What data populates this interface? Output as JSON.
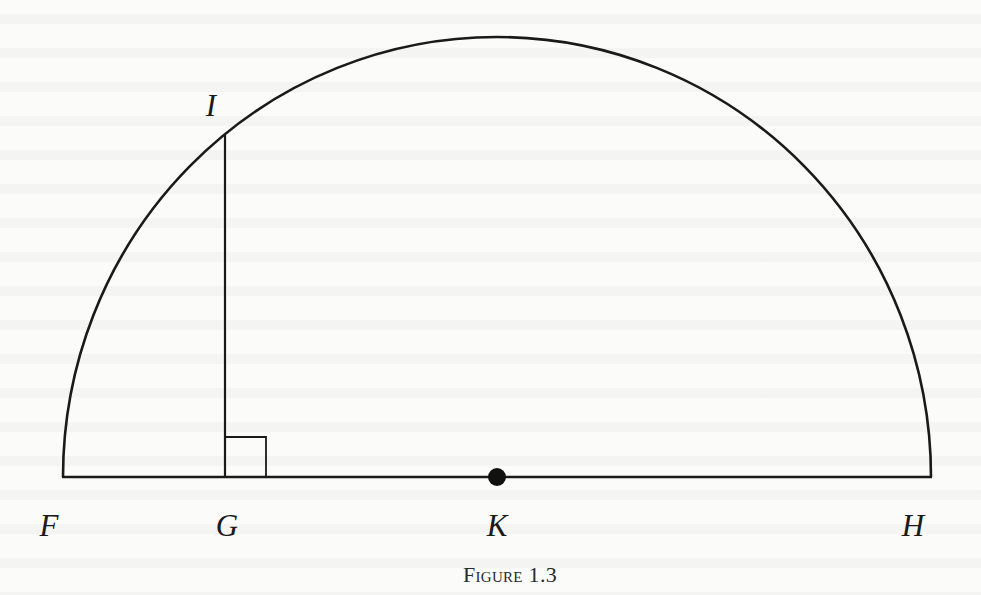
{
  "figure": {
    "caption": "Figure 1.3",
    "stroke_color": "#1a1a1a",
    "geometry": {
      "baseline_y": 477,
      "F_x": 63,
      "H_x": 931,
      "K_x": 497,
      "radius": 434,
      "G_x": 225,
      "I_y": 135,
      "right_angle_size": 40,
      "center_dot_radius": 9
    },
    "labels": {
      "I": "I",
      "F": "F",
      "G": "G",
      "K": "K",
      "H": "H"
    }
  }
}
